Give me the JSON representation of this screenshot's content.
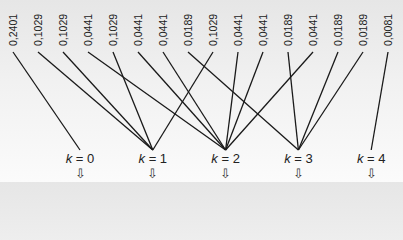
{
  "outcomes": [
    {
      "label": "0,2401",
      "k": 0
    },
    {
      "label": "0,1029",
      "k": 1
    },
    {
      "label": "0,1029",
      "k": 1
    },
    {
      "label": "0,0441",
      "k": 2
    },
    {
      "label": "0,1029",
      "k": 1
    },
    {
      "label": "0,0441",
      "k": 2
    },
    {
      "label": "0,0441",
      "k": 2
    },
    {
      "label": "0,0189",
      "k": 3
    },
    {
      "label": "0,1029",
      "k": 1
    },
    {
      "label": "0,0441",
      "k": 2
    },
    {
      "label": "0,0441",
      "k": 2
    },
    {
      "label": "0,0189",
      "k": 3
    },
    {
      "label": "0,0441",
      "k": 2
    },
    {
      "label": "0,0189",
      "k": 3
    },
    {
      "label": "0,0189",
      "k": 3
    },
    {
      "label": "0,0081",
      "k": 4
    }
  ],
  "groups": [
    {
      "var": "k",
      "eq": " = 0",
      "arrow": "⇩"
    },
    {
      "var": "k",
      "eq": " = 1",
      "arrow": "⇩"
    },
    {
      "var": "k",
      "eq": " = 2",
      "arrow": "⇩"
    },
    {
      "var": "k",
      "eq": " = 3",
      "arrow": "⇩"
    },
    {
      "var": "k",
      "eq": " = 4",
      "arrow": "⇩"
    }
  ],
  "colors": {
    "line": "#1a1a1a",
    "text": "#222222"
  }
}
